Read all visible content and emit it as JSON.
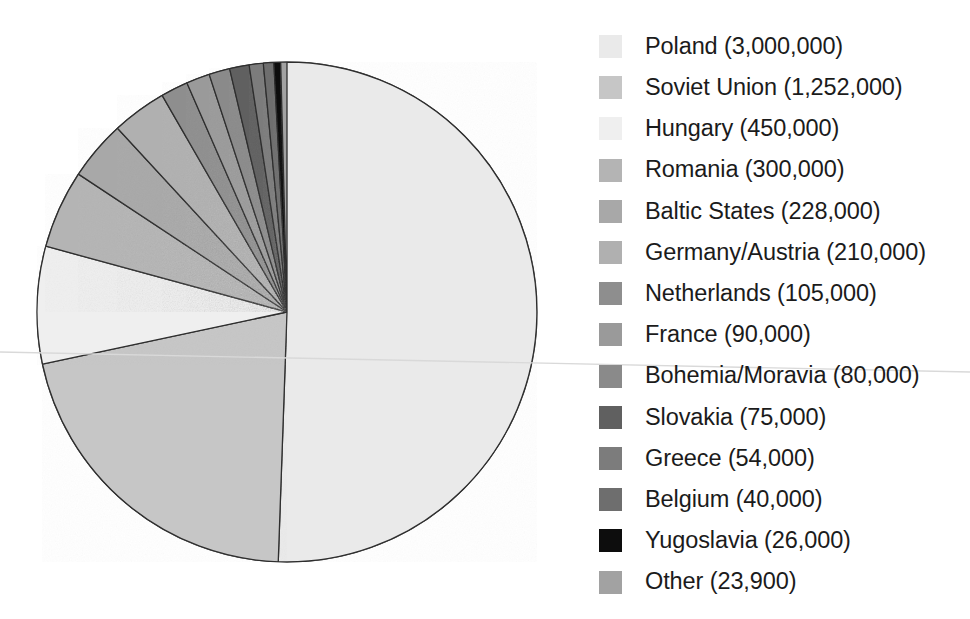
{
  "chart_data": {
    "type": "pie",
    "title": "",
    "subtitle": "",
    "xlabel": "",
    "ylabel": "",
    "legend_position": "right",
    "grid": false,
    "value_unit": "people",
    "total": 5933900,
    "start_angle_deg": 0,
    "direction": "clockwise",
    "categories": [
      "Poland",
      "Soviet Union",
      "Hungary",
      "Romania",
      "Baltic States",
      "Germany/Austria",
      "Netherlands",
      "France",
      "Bohemia/Moravia",
      "Slovakia",
      "Greece",
      "Belgium",
      "Yugoslavia",
      "Other"
    ],
    "values": [
      3000000,
      1252000,
      450000,
      300000,
      228000,
      210000,
      105000,
      90000,
      80000,
      75000,
      54000,
      40000,
      26000,
      23900
    ],
    "value_labels": [
      "3,000,000",
      "1,252,000",
      "450,000",
      "300,000",
      "228,000",
      "210,000",
      "105,000",
      "90,000",
      "80,000",
      "75,000",
      "54,000",
      "40,000",
      "26,000",
      "23,900"
    ],
    "colors": [
      "#eaeaea",
      "#c6c6c6",
      "#efefef",
      "#b4b4b4",
      "#a8a8a8",
      "#b0b0b0",
      "#8e8e8e",
      "#9a9a9a",
      "#8a8a8a",
      "#606060",
      "#7c7c7c",
      "#6e6e6e",
      "#0d0d0d",
      "#a2a2a2"
    ],
    "slice_order_note": "slices drawn clockwise from 12 o'clock in legend order"
  },
  "legend": {
    "items": [
      {
        "label": "Poland (3,000,000)",
        "name": "Poland",
        "value": 3000000,
        "color": "#eaeaea"
      },
      {
        "label": "Soviet Union (1,252,000)",
        "name": "Soviet Union",
        "value": 1252000,
        "color": "#c6c6c6"
      },
      {
        "label": "Hungary (450,000)",
        "name": "Hungary",
        "value": 450000,
        "color": "#efefef"
      },
      {
        "label": "Romania (300,000)",
        "name": "Romania",
        "value": 300000,
        "color": "#b4b4b4"
      },
      {
        "label": "Baltic States (228,000)",
        "name": "Baltic States",
        "value": 228000,
        "color": "#a8a8a8"
      },
      {
        "label": "Germany/Austria (210,000)",
        "name": "Germany/Austria",
        "value": 210000,
        "color": "#b0b0b0"
      },
      {
        "label": "Netherlands (105,000)",
        "name": "Netherlands",
        "value": 105000,
        "color": "#8e8e8e"
      },
      {
        "label": "France (90,000)",
        "name": "France",
        "value": 90000,
        "color": "#9a9a9a"
      },
      {
        "label": "Bohemia/Moravia (80,000)",
        "name": "Bohemia/Moravia",
        "value": 80000,
        "color": "#8a8a8a"
      },
      {
        "label": "Slovakia (75,000)",
        "name": "Slovakia",
        "value": 75000,
        "color": "#606060"
      },
      {
        "label": "Greece (54,000)",
        "name": "Greece",
        "value": 54000,
        "color": "#7c7c7c"
      },
      {
        "label": "Belgium (40,000)",
        "name": "Belgium",
        "value": 40000,
        "color": "#6e6e6e"
      },
      {
        "label": "Yugoslavia (26,000)",
        "name": "Yugoslavia",
        "value": 26000,
        "color": "#0d0d0d"
      },
      {
        "label": "Other (23,900)",
        "name": "Other",
        "value": 23900,
        "color": "#a2a2a2"
      }
    ]
  },
  "style": {
    "background": "#ffffff",
    "text_color": "#1b1b1b",
    "slice_stroke": "#2e2e2e"
  }
}
